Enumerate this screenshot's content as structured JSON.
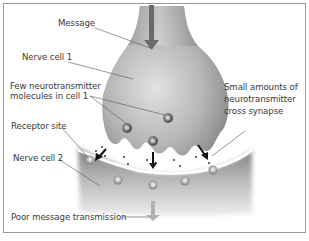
{
  "diagram": {
    "labels": {
      "message": "Message",
      "nerve_cell_1": "Nerve cell 1",
      "few_neurotransmitter_line1": "Few neurotransmitter",
      "few_neurotransmitter_line2": "molecules in cell 1",
      "small_amounts_line1": "Small amounts of",
      "small_amounts_line2": "neurotransmitter",
      "small_amounts_line3": "cross synapse",
      "receptor_site": "Receptor site",
      "nerve_cell_2": "Nerve cell 2",
      "poor_transmission": "Poor message transmission"
    },
    "colors": {
      "frame": "#9a9a9a",
      "cell": "#8f8f8f",
      "label_text": "#3a3a3a",
      "leader_line": "#555555",
      "arrow_dark": "#111111",
      "arrow_light": "#a8a8a8"
    }
  }
}
